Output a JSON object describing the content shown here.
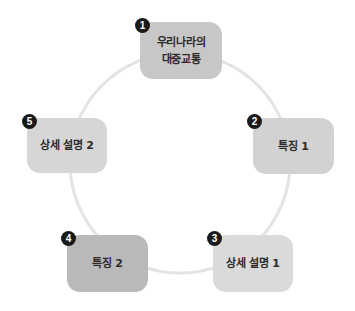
{
  "diagram": {
    "type": "cycle",
    "ring": {
      "cx": 180,
      "cy": 163,
      "r": 110,
      "stroke": "#e3e3e3",
      "stroke_width": 3
    },
    "nodes": [
      {
        "number": "1",
        "label": "우리나라의\n대중교통",
        "color": "#c7c7c7",
        "x": 140,
        "y": 22,
        "w": 82,
        "h": 57,
        "badge_x": 135,
        "badge_y": 18
      },
      {
        "number": "2",
        "label": "특징 1",
        "color": "#d2d2d2",
        "x": 253,
        "y": 118,
        "w": 81,
        "h": 56,
        "badge_x": 247,
        "badge_y": 114
      },
      {
        "number": "3",
        "label": "상세 설명 1",
        "color": "#dadada",
        "x": 213,
        "y": 235,
        "w": 80,
        "h": 57,
        "badge_x": 207,
        "badge_y": 231
      },
      {
        "number": "4",
        "label": "특징 2",
        "color": "#b9b9b9",
        "x": 67,
        "y": 235,
        "w": 81,
        "h": 57,
        "badge_x": 61,
        "badge_y": 231
      },
      {
        "number": "5",
        "label": "상세 설명 2",
        "color": "#d6d6d6",
        "x": 27,
        "y": 118,
        "w": 80,
        "h": 55,
        "badge_x": 22,
        "badge_y": 114
      }
    ]
  }
}
